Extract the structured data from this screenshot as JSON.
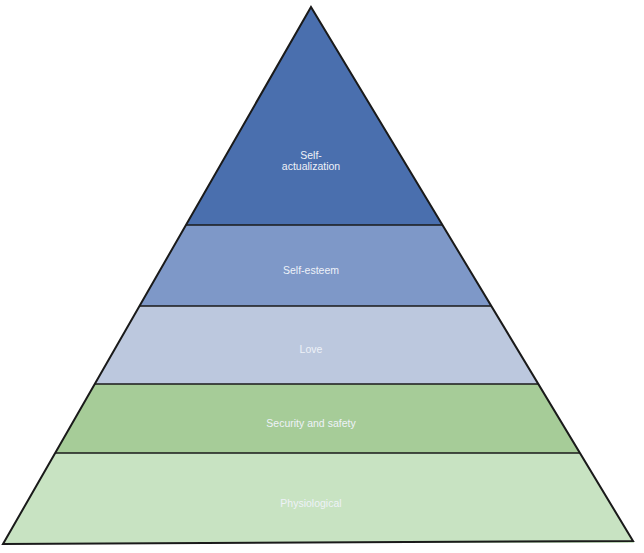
{
  "diagram": {
    "type": "pyramid",
    "apex": [
      311,
      7
    ],
    "base_left": [
      3,
      544
    ],
    "base_right": [
      633,
      541
    ],
    "outline_color": "#1a1a1a",
    "tiers": [
      {
        "label_lines": [
          "Self-",
          "actualization"
        ],
        "label": "Self-actualization",
        "y_top": 7,
        "y_bottom": 225,
        "color": "#4a6fae",
        "label_y": 160
      },
      {
        "label_lines": [
          "Self-esteem"
        ],
        "label": "Self-esteem",
        "y_top": 225,
        "y_bottom": 306,
        "color": "#7e98c8",
        "label_y": 270
      },
      {
        "label_lines": [
          "Love"
        ],
        "label": "Love",
        "y_top": 306,
        "y_bottom": 384,
        "color": "#bcc8de",
        "label_y": 349
      },
      {
        "label_lines": [
          "Security and safety"
        ],
        "label": "Security and safety",
        "y_top": 384,
        "y_bottom": 453,
        "color": "#a6cc98",
        "label_y": 423
      },
      {
        "label_lines": [
          "Physiological"
        ],
        "label": "Physiological",
        "y_top": 453,
        "y_bottom": 543,
        "color": "#c8e3c2",
        "label_y": 503
      }
    ]
  }
}
